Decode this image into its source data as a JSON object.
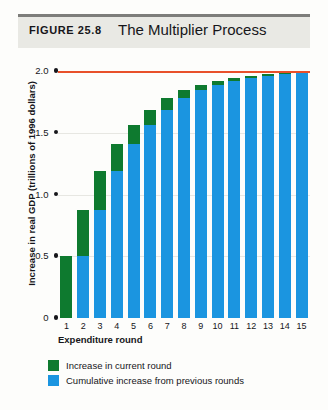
{
  "header": {
    "figure_label": "FIGURE 25.8",
    "title": "The Multiplier Process"
  },
  "legend": [
    {
      "label": "Increase in current round",
      "color": "#0e7a2f",
      "key": "green"
    },
    {
      "label": "Cumulative increase from previous rounds",
      "color": "#1b95e0",
      "key": "blue"
    }
  ],
  "colors": {
    "green": "#0e7a2f",
    "blue": "#1b95e0",
    "target_line": "#e8502a",
    "header_band": "#e9e9e4",
    "header_rule": "#7d7d7a",
    "text": "#16161a",
    "gridline": "#e7e7e2"
  },
  "chart_data": {
    "type": "bar",
    "stacked": true,
    "title": "The Multiplier Process",
    "xlabel": "Expenditure round",
    "ylabel": "Increase in real GDP (trillions of 1996 dollars)",
    "categories": [
      "1",
      "2",
      "3",
      "4",
      "5",
      "6",
      "7",
      "8",
      "9",
      "10",
      "11",
      "12",
      "13",
      "14",
      "15"
    ],
    "ylim": [
      0,
      2.0
    ],
    "yticks": [
      0,
      0.5,
      1.0,
      1.5,
      2.0
    ],
    "ytick_labels": [
      "0",
      "0.5",
      "1.0",
      "1.5",
      "2.0"
    ],
    "grid": true,
    "legend_position": "below",
    "series": [
      {
        "name": "Cumulative increase from previous rounds",
        "color": "#1b95e0",
        "values": [
          0,
          0.5,
          0.875,
          1.1875,
          1.4063,
          1.5625,
          1.6875,
          1.7813,
          1.8438,
          1.8906,
          1.9219,
          1.9453,
          1.9609,
          1.9727,
          1.9805
        ]
      },
      {
        "name": "Increase in current round",
        "color": "#0e7a2f",
        "values": [
          0.5,
          0.375,
          0.3125,
          0.2188,
          0.1562,
          0.125,
          0.0938,
          0.0625,
          0.0468,
          0.0313,
          0.0234,
          0.0156,
          0.0118,
          0.0078,
          0.0059
        ]
      }
    ],
    "totals": [
      0.5,
      0.875,
      1.1875,
      1.4063,
      1.5625,
      1.6875,
      1.7813,
      1.8438,
      1.8906,
      1.9219,
      1.9453,
      1.9609,
      1.9727,
      1.9805,
      1.9864
    ],
    "annotations": [
      {
        "type": "hline",
        "value": 2.0,
        "color": "#e8502a",
        "label": "equilibrium level"
      }
    ]
  }
}
